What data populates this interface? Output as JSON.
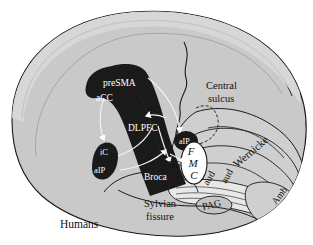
{
  "figure": {
    "caption": "Humans",
    "species_label": "Humans",
    "type": "lateral brain schematic",
    "colors": {
      "cortex_fill": "#c9c9c9",
      "cortex_fill_light": "#d6d6d6",
      "dark_region_fill": "#1a1a1a",
      "outline": "#1a1a1a",
      "white_label": "#ffffff",
      "black_label": "#111111",
      "connector_white": "#f2f2f2",
      "background": "#ffffff"
    }
  },
  "labels": {
    "dark_region": [
      {
        "id": "preSMA",
        "text": "preSMA"
      },
      {
        "id": "aCC",
        "text": "aCC"
      },
      {
        "id": "DLPFC",
        "text": "DLPFC"
      },
      {
        "id": "Broca",
        "text": "Broca"
      },
      {
        "id": "iC",
        "text": "iC"
      },
      {
        "id": "aIP",
        "text": "aIP"
      },
      {
        "id": "dIP",
        "text": "aIP"
      }
    ],
    "anatomy": [
      {
        "id": "central_sulcus_line1",
        "text": "Central"
      },
      {
        "id": "central_sulcus_line2",
        "text": "sulcus"
      },
      {
        "id": "sylvian_line1",
        "text": "Sylvian"
      },
      {
        "id": "sylvian_line2",
        "text": "fissure"
      },
      {
        "id": "wernicke",
        "text": "Wernicke"
      },
      {
        "id": "aud_left",
        "text": "aud"
      },
      {
        "id": "aud_right",
        "text": "aud"
      },
      {
        "id": "amb",
        "text": "Amb"
      },
      {
        "id": "pag",
        "text": "PAG"
      },
      {
        "id": "ns",
        "text": "NS"
      }
    ],
    "fmc_stack": [
      {
        "id": "F",
        "text": "F"
      },
      {
        "id": "M",
        "text": "M"
      },
      {
        "id": "C",
        "text": "C"
      }
    ]
  }
}
